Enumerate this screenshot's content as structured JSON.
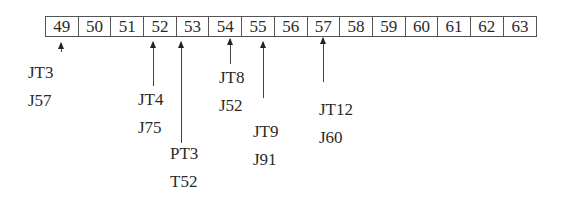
{
  "diagram": {
    "cells": [
      "49",
      "50",
      "51",
      "52",
      "53",
      "54",
      "55",
      "56",
      "57",
      "58",
      "59",
      "60",
      "61",
      "62",
      "63"
    ],
    "pointers": [
      {
        "target": "49",
        "lines": [
          "JT3",
          "J57"
        ]
      },
      {
        "target": "52",
        "lines": [
          "JT4",
          "J75"
        ]
      },
      {
        "target": "53",
        "lines": [
          "PT3",
          "T52"
        ]
      },
      {
        "target": "54",
        "lines": [
          "JT8",
          "J52"
        ]
      },
      {
        "target": "55",
        "lines": [
          "JT9",
          "J91"
        ]
      },
      {
        "target": "57",
        "lines": [
          "JT12",
          "J60"
        ]
      }
    ]
  }
}
